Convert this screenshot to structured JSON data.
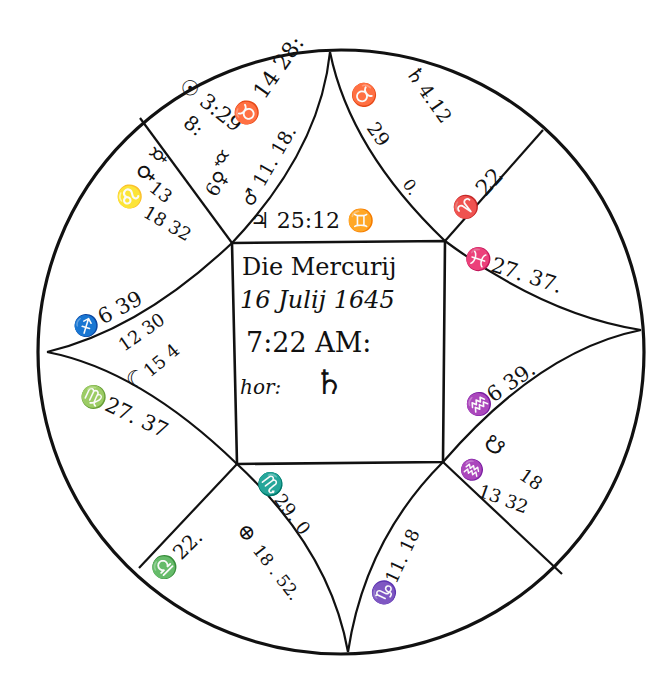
{
  "figure": {
    "type": "square horoscope chart (astrological nativity figure)",
    "ink_color": "#111111",
    "paper_color": "#ffffff"
  },
  "center_box": {
    "line1": "Die Mercurij",
    "line2": "16 Julij 1645",
    "line3": "7:22 AM:",
    "line4_label": "hor:",
    "line4_symbol": "♄"
  },
  "houses": {
    "top_center": {
      "planet": "♃ 25:12 ♊",
      "planet_symbol": "♃",
      "value": "25:12",
      "sign": "♊"
    },
    "top_left_outer": {
      "cusp_sign_text": "♉ 14 28:",
      "line_text": "♂ 11. 18.",
      "extra": "6♀"
    },
    "top_left_inner": {
      "sun_text": "☉ 3:29",
      "node_text": "8:",
      "planet_symbol": "☿"
    },
    "left_upper_cusp": {
      "text": "♌ ♀ ☿",
      "numbers_a": "13",
      "numbers_b": "18 32"
    },
    "top_right_cusp": {
      "sign": "♉",
      "degree": "29",
      "minutes": "0."
    },
    "top_right_planet": {
      "symbol": "♄",
      "value": "4.12"
    },
    "right_upper_cusp": {
      "text": "♈ 22"
    },
    "right_cusp": {
      "sign": "♓",
      "value": "27. 37."
    },
    "right_lower_cusp": {
      "sign": "♒",
      "value": "6 39."
    },
    "right_lower_planets": {
      "node_symbol": "☋",
      "node_value": "18",
      "sign": "♒",
      "value": "13 32"
    },
    "bottom_right_cusp": {
      "sign": "♑",
      "value": "11. 18"
    },
    "bottom_center_cusp": {
      "sign": "♏",
      "value": "29. 0"
    },
    "bottom_left_planet": {
      "symbol": "⊕",
      "value": "18 . 52."
    },
    "bottom_left_cusp": {
      "sign": "♎",
      "value": "22."
    },
    "left_lower_cusp": {
      "sign": "♍",
      "value": "27. 37"
    },
    "left_cusp": {
      "sign": "♐",
      "value": "6 39"
    },
    "left_planets": {
      "moon_value": "12 30",
      "moon_symbol": "☽",
      "mars_value": "15 4",
      "moon_glyph": "☾"
    }
  }
}
